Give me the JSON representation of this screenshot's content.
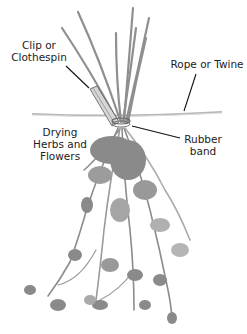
{
  "diagram": {
    "labels": {
      "clip": {
        "line1": "Clip or",
        "line2": "Clothespin"
      },
      "rope": {
        "line1": "Rope or Twine"
      },
      "herbs": {
        "line1": "Drying",
        "line2": "Herbs and",
        "line3": "Flowers"
      },
      "band": {
        "line1": "Rubber",
        "line2": "band"
      }
    },
    "colors": {
      "stems": "#8a8a8a",
      "foliage": "#8c8c8c",
      "foliage_light": "#b0b0b0",
      "rope": "#b8b8b8",
      "leader_lines": "#111111",
      "text": "#222222"
    }
  }
}
